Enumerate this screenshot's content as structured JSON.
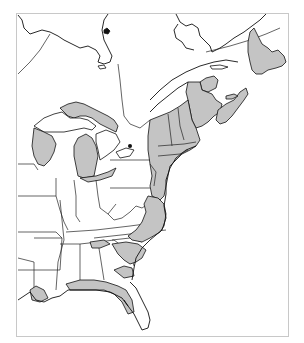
{
  "map": {
    "region": "Eastern North America",
    "colors": {
      "shaded": "#c4c4c4",
      "border": "#111111",
      "background": "#ffffff",
      "frame": "#c8c8c8"
    },
    "legend": null,
    "labels": []
  }
}
